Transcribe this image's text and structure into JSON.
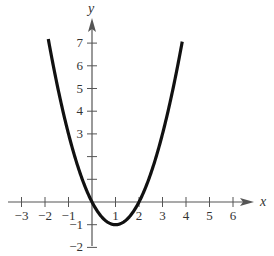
{
  "chart_data": {
    "type": "line",
    "title": "",
    "xlabel": "x",
    "ylabel": "y",
    "function": "y = x^2 - 2x",
    "xlim": [
      -3,
      6
    ],
    "ylim": [
      -2,
      7
    ],
    "x_ticks": [
      -3,
      -2,
      -1,
      1,
      2,
      3,
      4,
      5,
      6
    ],
    "y_ticks": [
      -2,
      -1,
      1,
      2,
      3,
      4,
      5,
      6,
      7
    ],
    "x_tick_labels": [
      "−3",
      "−2",
      "−1",
      "1",
      "2",
      "3",
      "4",
      "5",
      "6"
    ],
    "y_tick_labels": [
      "−2",
      "−1",
      "3",
      "4",
      "5",
      "6",
      "7"
    ],
    "series": [
      {
        "name": "parabola",
        "x": [
          -1.8,
          -1,
          0,
          1,
          2,
          3,
          3.8
        ],
        "y": [
          6.84,
          3,
          0,
          -1,
          0,
          3,
          6.84
        ]
      }
    ],
    "vertex": [
      1,
      -1
    ],
    "x_intercepts": [
      0,
      2
    ],
    "grid": false,
    "legend": false
  },
  "axes": {
    "x_label": "x",
    "y_label": "y"
  }
}
